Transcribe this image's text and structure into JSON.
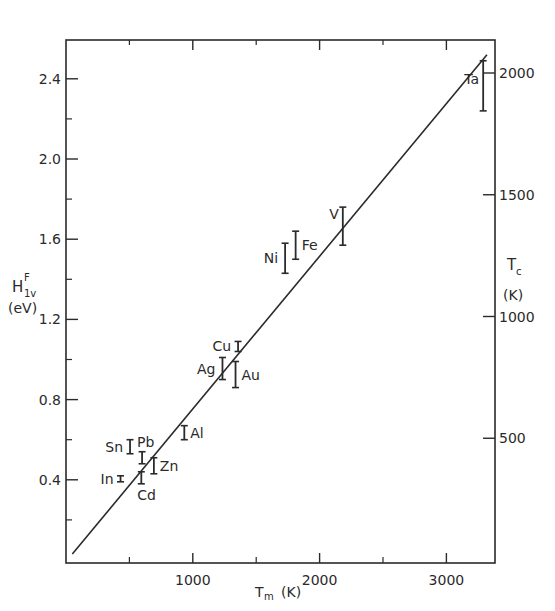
{
  "chart_data": {
    "type": "scatter",
    "title": "",
    "xlabel": "T_m (K)",
    "ylabel": "H_1v^F (eV)",
    "y2label": "T_c (K)",
    "xlim": [
      0,
      3400
    ],
    "ylim": [
      0,
      2.6
    ],
    "y2lim": [
      0,
      2130
    ],
    "x_ticks": [
      1000,
      2000,
      3000
    ],
    "x_minor_ticks": [
      500,
      1500,
      2500
    ],
    "y_ticks": [
      0.4,
      0.8,
      1.2,
      1.6,
      2.0,
      2.4
    ],
    "y_tick_labels": [
      "0.4",
      "0.8",
      "1.2",
      "1.6",
      "2.0",
      "2.4"
    ],
    "y_minor_ticks": [
      0.2,
      0.6,
      1.0,
      1.4,
      1.8,
      2.2
    ],
    "y2_ticks": [
      500,
      1000,
      1500,
      2000
    ],
    "grid": false,
    "fit_line": {
      "x": [
        50,
        3320
      ],
      "y": [
        0.03,
        2.52
      ]
    },
    "series": [
      {
        "name": "In",
        "x": 430,
        "y_low": 0.39,
        "y_high": 0.42,
        "label_side": "left"
      },
      {
        "name": "Sn",
        "x": 505,
        "y_low": 0.53,
        "y_high": 0.6,
        "label_side": "left"
      },
      {
        "name": "Pb",
        "x": 600,
        "y_low": 0.48,
        "y_high": 0.54,
        "label_side": "above-right"
      },
      {
        "name": "Cd",
        "x": 594,
        "y_low": 0.38,
        "y_high": 0.44,
        "label_side": "below"
      },
      {
        "name": "Zn",
        "x": 693,
        "y_low": 0.43,
        "y_high": 0.51,
        "label_side": "right"
      },
      {
        "name": "Al",
        "x": 933,
        "y_low": 0.6,
        "y_high": 0.67,
        "label_side": "right"
      },
      {
        "name": "Cu",
        "x": 1357,
        "y_low": 1.04,
        "y_high": 1.09,
        "label_side": "left"
      },
      {
        "name": "Ag",
        "x": 1234,
        "y_low": 0.9,
        "y_high": 1.01,
        "label_side": "left"
      },
      {
        "name": "Au",
        "x": 1337,
        "y_low": 0.86,
        "y_high": 0.99,
        "label_side": "right"
      },
      {
        "name": "Ni",
        "x": 1728,
        "y_low": 1.43,
        "y_high": 1.58,
        "label_side": "left"
      },
      {
        "name": "Fe",
        "x": 1811,
        "y_low": 1.5,
        "y_high": 1.64,
        "label_side": "right"
      },
      {
        "name": "V",
        "x": 2183,
        "y_low": 1.57,
        "y_high": 1.76,
        "label_side": "above-left"
      },
      {
        "name": "Ta",
        "x": 3290,
        "y_low": 2.24,
        "y_high": 2.49,
        "label_side": "left"
      }
    ]
  },
  "labels": {
    "y_axis_main": "H",
    "y_axis_sup": "F",
    "y_axis_sub": "1v",
    "y_axis_unit": "(eV)",
    "y2_axis_main": "T",
    "y2_axis_sub": "c",
    "y2_axis_unit": "(K)",
    "x_axis_main": "T",
    "x_axis_sub": "m",
    "x_axis_unit": "(K)"
  }
}
